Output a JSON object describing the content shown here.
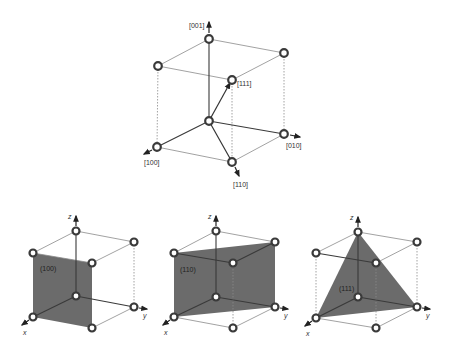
{
  "figure": {
    "top_cube": {
      "title": "Crystal directions in cubic unit cell",
      "directions": [
        {
          "label": "[001]"
        },
        {
          "label": "[111]"
        },
        {
          "label": "[100]"
        },
        {
          "label": "[010]"
        },
        {
          "label": "[110]"
        }
      ]
    },
    "planes": [
      {
        "label": "(100)",
        "axes": {
          "x": "x",
          "y": "y",
          "z": "z"
        }
      },
      {
        "label": "(110)",
        "axes": {
          "x": "x",
          "y": "y",
          "z": "z"
        }
      },
      {
        "label": "(111)",
        "axes": {
          "x": "x",
          "y": "y",
          "z": "z"
        }
      }
    ],
    "colors": {
      "plane_fill": "#6b6b6b",
      "edge": "#3a3a3a",
      "background": "#ffffff"
    }
  }
}
